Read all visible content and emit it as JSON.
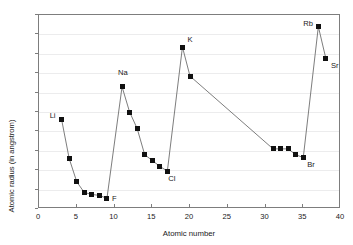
{
  "chart_data": {
    "type": "line",
    "title": "",
    "subtitle": "",
    "xlabel": "Atomic number",
    "ylabel": "Atomic radius (in angstrom)",
    "xlim": [
      0,
      40
    ],
    "ylim": [
      0.6,
      2.6
    ],
    "xticks": [
      0,
      5,
      10,
      15,
      20,
      25,
      30,
      35,
      40
    ],
    "xtick_labels": [
      "0",
      "5",
      "10",
      "15",
      "20",
      "25",
      "30",
      "35",
      "40"
    ],
    "yticks": [
      0.6,
      0.8,
      1.0,
      1.2,
      1.4,
      1.6,
      1.8,
      2.0,
      2.2,
      2.4,
      2.6
    ],
    "ytick_labels": [
      "0.6",
      "0.8",
      "1",
      "1.2",
      "1.4",
      "1.6",
      "1.8",
      "2",
      "2.2",
      "2.4",
      "2.6"
    ],
    "grid": "horizontal",
    "grid_color": "#ececed",
    "legend": "none",
    "marker_style": "filled-square",
    "marker_color": "#111111",
    "line_color": "#6e6e6e",
    "series": [
      {
        "name": "Atomic radius",
        "points": [
          {
            "x": 3,
            "y": 1.52,
            "label": "Li"
          },
          {
            "x": 4,
            "y": 1.12,
            "label": ""
          },
          {
            "x": 5,
            "y": 0.88,
            "label": ""
          },
          {
            "x": 6,
            "y": 0.77,
            "label": ""
          },
          {
            "x": 7,
            "y": 0.75,
            "label": ""
          },
          {
            "x": 8,
            "y": 0.74,
            "label": ""
          },
          {
            "x": 9,
            "y": 0.71,
            "label": "F"
          },
          {
            "x": 11,
            "y": 1.86,
            "label": "Na"
          },
          {
            "x": 12,
            "y": 1.6,
            "label": ""
          },
          {
            "x": 13,
            "y": 1.43,
            "label": ""
          },
          {
            "x": 14,
            "y": 1.16,
            "label": ""
          },
          {
            "x": 15,
            "y": 1.1,
            "label": ""
          },
          {
            "x": 16,
            "y": 1.04,
            "label": ""
          },
          {
            "x": 17,
            "y": 0.99,
            "label": "Cl"
          },
          {
            "x": 19,
            "y": 2.27,
            "label": "K"
          },
          {
            "x": 20,
            "y": 1.97,
            "label": ""
          },
          {
            "x": 31,
            "y": 1.22,
            "label": ""
          },
          {
            "x": 32,
            "y": 1.22,
            "label": ""
          },
          {
            "x": 33,
            "y": 1.22,
            "label": ""
          },
          {
            "x": 34,
            "y": 1.16,
            "label": ""
          },
          {
            "x": 35,
            "y": 1.13,
            "label": "Br"
          },
          {
            "x": 37,
            "y": 2.48,
            "label": "Rb"
          },
          {
            "x": 38,
            "y": 2.15,
            "label": "Sr"
          }
        ]
      }
    ],
    "label_offsets": {
      "Li": {
        "dx": -12,
        "dy": -4
      },
      "F": {
        "dx": 5,
        "dy": 1
      },
      "Na": {
        "dx": -4,
        "dy": -14
      },
      "Cl": {
        "dx": 1,
        "dy": 8
      },
      "K": {
        "dx": 5,
        "dy": -7
      },
      "Br": {
        "dx": 4,
        "dy": 7
      },
      "Rb": {
        "dx": -15,
        "dy": -3
      },
      "Sr": {
        "dx": 5,
        "dy": 7
      }
    }
  }
}
